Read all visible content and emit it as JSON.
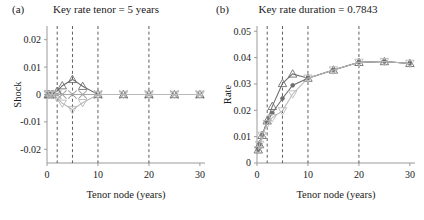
{
  "figure": {
    "panels": [
      {
        "tag": "(a)",
        "title": "Key rate tenor = 5 years",
        "xlabel": "Tenor node (years)",
        "ylabel": "Shock"
      },
      {
        "tag": "(b)",
        "title": "Key rate duration = 0.7843",
        "xlabel": "Tenor node (years)",
        "ylabel": "Rate"
      }
    ]
  },
  "colors": {
    "axis": "#9a9a9a",
    "gridline": "#4d4d4d",
    "base_series": "#a8a8a8",
    "up_series": "#6e6e6e",
    "down_series": "#b9b9b9",
    "text": "#1a1a1a"
  },
  "chart_data": [
    {
      "type": "line",
      "panel": "a",
      "title": "Key rate tenor = 5 years",
      "xlabel": "Tenor node (years)",
      "ylabel": "Shock",
      "xlim": [
        0,
        31
      ],
      "ylim": [
        -0.025,
        0.025
      ],
      "xticks": [
        0,
        10,
        20,
        30
      ],
      "xtick_labels": [
        "0",
        "10",
        "20",
        "30"
      ],
      "yticks": [
        -0.02,
        -0.01,
        0,
        0.01,
        0.02
      ],
      "ytick_labels": [
        "-0.02",
        "-0.01",
        "0",
        "0.01",
        "0.02"
      ],
      "grid": false,
      "vlines": [
        2,
        5,
        10,
        20
      ],
      "legend": "none",
      "x": [
        0.25,
        0.5,
        1,
        2,
        3,
        5,
        7,
        10,
        15,
        20,
        25,
        30
      ],
      "series": [
        {
          "name": "Base (no shock)",
          "marker": "x",
          "color": "#a8a8a8",
          "values": [
            0,
            0,
            0,
            0,
            0,
            0,
            0,
            0,
            0,
            0,
            0,
            0
          ]
        },
        {
          "name": "Upward shock",
          "marker": "triangle-up",
          "color": "#6e6e6e",
          "values": [
            0,
            0,
            0,
            0.0012,
            0.0032,
            0.0055,
            0.003,
            0,
            0,
            0,
            0,
            0
          ]
        },
        {
          "name": "Downward shock",
          "marker": "triangle-down",
          "color": "#b9b9b9",
          "values": [
            0,
            0,
            0,
            -0.0012,
            -0.0032,
            -0.0055,
            -0.003,
            0,
            0,
            0,
            0,
            0
          ]
        }
      ]
    },
    {
      "type": "line",
      "panel": "b",
      "title": "Key rate duration = 0.7843",
      "xlabel": "Tenor node (years)",
      "ylabel": "Rate",
      "xlim": [
        0,
        31
      ],
      "ylim": [
        0,
        0.052
      ],
      "xticks": [
        0,
        10,
        20,
        30
      ],
      "xtick_labels": [
        "0",
        "10",
        "20",
        "30"
      ],
      "yticks": [
        0,
        0.01,
        0.02,
        0.03,
        0.04,
        0.05
      ],
      "ytick_labels": [
        "0",
        "0.01",
        "0.02",
        "0.03",
        "0.04",
        "0.05"
      ],
      "grid": false,
      "vlines": [
        2,
        5,
        10,
        20
      ],
      "legend": "none",
      "key_rate_duration": 0.7843,
      "x": [
        0.25,
        0.5,
        1,
        2,
        3,
        5,
        7,
        10,
        15,
        20,
        25,
        30
      ],
      "series": [
        {
          "name": "Base curve",
          "marker": "circle",
          "color": "#6e6e6e",
          "values": [
            0.005,
            0.007,
            0.0105,
            0.0155,
            0.019,
            0.0245,
            0.0295,
            0.0322,
            0.0353,
            0.0382,
            0.0385,
            0.0378
          ]
        },
        {
          "name": "Shocked up curve",
          "marker": "triangle-up",
          "color": "#6e6e6e",
          "values": [
            0.005,
            0.007,
            0.0105,
            0.016,
            0.0215,
            0.0302,
            0.0338,
            0.0322,
            0.0353,
            0.0382,
            0.0385,
            0.0378
          ]
        },
        {
          "name": "Shocked down curve",
          "marker": "triangle-down",
          "color": "#b9b9b9",
          "values": [
            0.005,
            0.007,
            0.0105,
            0.015,
            0.0172,
            0.0198,
            0.0262,
            0.0322,
            0.0353,
            0.0382,
            0.0385,
            0.0378
          ]
        }
      ]
    }
  ]
}
